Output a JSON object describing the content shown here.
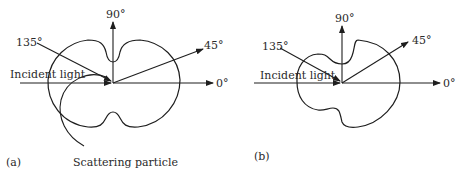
{
  "panels": [
    {
      "id": "a",
      "caption": "(a)",
      "angle_labels": {
        "deg0": "0°",
        "deg45": "45°",
        "deg90": "90°",
        "deg135": "135°"
      },
      "incident_label": "Incident light",
      "particle_label": "Scattering particle"
    },
    {
      "id": "b",
      "caption": "(b)",
      "angle_labels": {
        "deg0": "0°",
        "deg45": "45°",
        "deg90": "90°",
        "deg135": "135°"
      },
      "incident_label": "Incident light"
    }
  ],
  "colors": {
    "ink": "#1e1e1e",
    "background": "#ffffff"
  }
}
